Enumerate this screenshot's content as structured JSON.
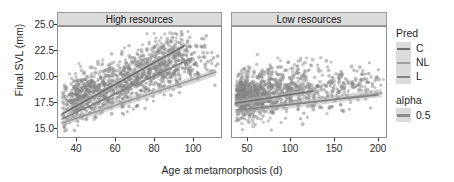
{
  "chart_data": {
    "type": "scatter",
    "title": "",
    "xlabel": "Age at metamorphosis (d)",
    "ylabel": "Final SVL (mm)",
    "grid": false,
    "legend_position": "right",
    "facets": [
      {
        "label": "High resources",
        "xlim": [
          33,
          118
        ],
        "ylim": [
          14.0,
          25.6
        ],
        "xticks": [
          40,
          60,
          80,
          100
        ],
        "series": [
          {
            "name": "C",
            "n_points": 430,
            "fit_line": {
              "x": [
                36,
                97
              ],
              "y": [
                17.9,
                23.9
              ]
            },
            "note": "steepest slope, upper line"
          },
          {
            "name": "NL",
            "n_points": 430,
            "fit_line": {
              "x": [
                36,
                113
              ],
              "y": [
                17.2,
                22.5
              ]
            },
            "note": "lower line extending farthest right"
          },
          {
            "name": "L",
            "n_points": 430,
            "fit_line": {
              "x": [
                36,
                100
              ],
              "y": [
                17.5,
                22.9
              ]
            },
            "note": "intermediate, overlapping"
          }
        ]
      },
      {
        "label": "Low resources",
        "xlim": [
          35,
          208
        ],
        "ylim": [
          14.0,
          25.6
        ],
        "xticks": [
          50,
          100,
          150,
          200
        ],
        "series": [
          {
            "name": "C",
            "n_points": 400,
            "fit_line": {
              "x": [
                40,
                124
              ],
              "y": [
                18.2,
                20.9
              ]
            },
            "note": "short upper line, steeper"
          },
          {
            "name": "NL",
            "n_points": 400,
            "fit_line": {
              "x": [
                40,
                202
              ],
              "y": [
                17.9,
                19.8
              ]
            },
            "note": "long nearly-flat line"
          },
          {
            "name": "L",
            "n_points": 400,
            "fit_line": {
              "x": [
                40,
                198
              ],
              "y": [
                18.0,
                19.6
              ]
            },
            "note": "long nearly-flat line, overlapping NL"
          }
        ]
      }
    ],
    "yticks": [
      15.0,
      17.5,
      20.0,
      22.5,
      25.0
    ],
    "ytick_labels": [
      "15.0",
      "17.5",
      "20.0",
      "22.5",
      "25.0"
    ],
    "point_color": "#8c8c8c",
    "point_alpha": 0.5,
    "ribbon_color": "#b5b5b5"
  },
  "axes": {
    "y_title": "Final SVL (mm)",
    "x_title": "Age at metamorphosis (d)",
    "y_tick_labels": [
      "25.0",
      "22.5",
      "20.0",
      "17.5",
      "15.0"
    ],
    "x_tick_labels_high": [
      "40",
      "60",
      "80",
      "100"
    ],
    "x_tick_labels_low": [
      "50",
      "100",
      "150",
      "200"
    ]
  },
  "strips": {
    "high": "High resources",
    "low": "Low resources"
  },
  "legend": {
    "pred": {
      "title": "Pred",
      "items": [
        {
          "label": "C",
          "color": "#6e6e6e"
        },
        {
          "label": "NL",
          "color": "#9e9e9e"
        },
        {
          "label": "L",
          "color": "#838383"
        }
      ]
    },
    "alpha": {
      "title": "alpha",
      "items": [
        {
          "label": "0.5",
          "color": "#8a8a8a"
        }
      ]
    }
  }
}
